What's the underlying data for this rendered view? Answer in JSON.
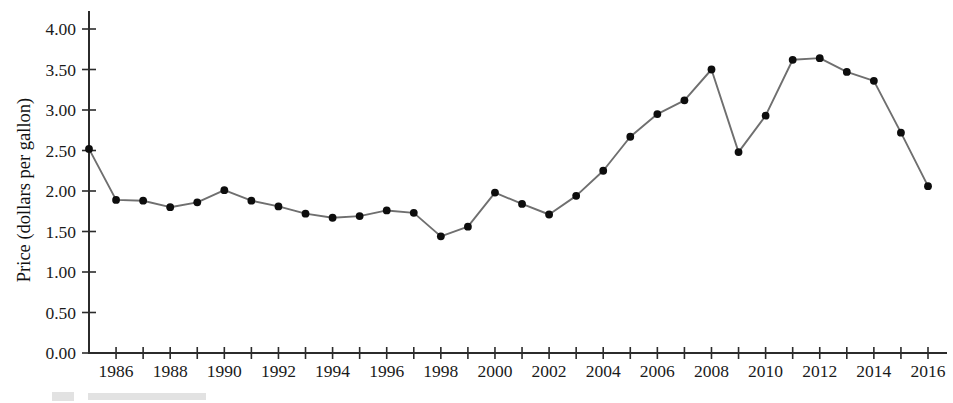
{
  "chart_data": {
    "type": "line",
    "title": "",
    "xlabel": "",
    "ylabel": "Price (dollars per gallon)",
    "xlim": [
      1985,
      2016
    ],
    "ylim": [
      0.0,
      4.0
    ],
    "grid": false,
    "legend": null,
    "marker": "filled-circle",
    "line_color": "#6f6f6f",
    "marker_color": "#0d0d0d",
    "axis_color": "#2b2b2b",
    "x_tick_interval": 1,
    "x_label_interval": 2,
    "y_tick_interval": 0.5,
    "x": [
      1985,
      1986,
      1987,
      1988,
      1989,
      1990,
      1991,
      1992,
      1993,
      1994,
      1995,
      1996,
      1997,
      1998,
      1999,
      2000,
      2001,
      2002,
      2003,
      2004,
      2005,
      2006,
      2007,
      2008,
      2009,
      2010,
      2011,
      2012,
      2013,
      2014,
      2015,
      2016
    ],
    "values": [
      2.52,
      1.89,
      1.88,
      1.8,
      1.86,
      2.01,
      1.88,
      1.81,
      1.72,
      1.67,
      1.69,
      1.76,
      1.73,
      1.44,
      1.56,
      1.98,
      1.84,
      1.71,
      1.94,
      2.25,
      2.67,
      2.95,
      3.12,
      3.5,
      2.48,
      2.93,
      3.62,
      3.64,
      3.47,
      3.36,
      2.72,
      2.06
    ],
    "x_tick_labels": [
      "1986",
      "1988",
      "1990",
      "1992",
      "1994",
      "1996",
      "1998",
      "2000",
      "2002",
      "2004",
      "2006",
      "2008",
      "2010",
      "2012",
      "2014",
      "2016"
    ],
    "x_tick_label_values": [
      1986,
      1988,
      1990,
      1992,
      1994,
      1996,
      1998,
      2000,
      2002,
      2004,
      2006,
      2008,
      2010,
      2012,
      2014,
      2016
    ],
    "y_tick_labels": [
      "0.00",
      "0.50",
      "1.00",
      "1.50",
      "2.00",
      "2.50",
      "3.00",
      "3.50",
      "4.00"
    ],
    "y_tick_values": [
      0.0,
      0.5,
      1.0,
      1.5,
      2.0,
      2.5,
      3.0,
      3.5,
      4.0
    ]
  }
}
